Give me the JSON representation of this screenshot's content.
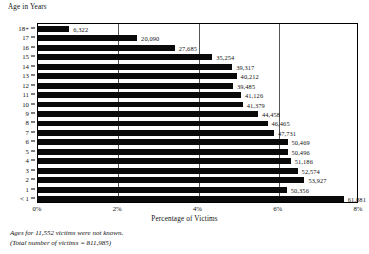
{
  "chart_data": {
    "type": "bar",
    "orientation": "horizontal",
    "title": "",
    "ylabel": "Age in Years",
    "xlabel": "Percentage of Victims",
    "categories": [
      "18+",
      "17",
      "16",
      "15",
      "14",
      "13",
      "12",
      "11",
      "10",
      "9",
      "8",
      "7",
      "6",
      "5",
      "4",
      "3",
      "2",
      "1",
      "< 1"
    ],
    "values": [
      6322,
      20090,
      27685,
      35254,
      39317,
      40212,
      39485,
      41126,
      41379,
      44458,
      46465,
      47731,
      50469,
      50496,
      51186,
      52574,
      53927,
      50356,
      61881
    ],
    "data_labels": [
      "6,322",
      "20,090",
      "27,685",
      "35,254",
      "39,317",
      "40,212",
      "39,485",
      "41,126",
      "41,379",
      "44,458",
      "46,465",
      "47,731",
      "50,469",
      "50,496",
      "51,186",
      "52,574",
      "53,927",
      "50,356",
      "61,881"
    ],
    "percentages": [
      0.78,
      2.47,
      3.41,
      4.34,
      4.84,
      4.95,
      4.86,
      5.06,
      5.1,
      5.48,
      5.72,
      5.88,
      6.22,
      6.22,
      6.3,
      6.47,
      6.64,
      6.2,
      7.62
    ],
    "xlim": [
      0,
      8
    ],
    "xticks": [
      "0%",
      "2%",
      "4%",
      "6%",
      "8%"
    ],
    "xtick_values": [
      0,
      2,
      4,
      6,
      8
    ],
    "grid": true,
    "legend": "none",
    "bar_color": "#0a0a0a",
    "total_victims": 811985,
    "unknown_ages": 11552
  },
  "footnotes": [
    "Ages for 11,552 victims were not known.",
    "(Total number of victims = 811,985)"
  ]
}
